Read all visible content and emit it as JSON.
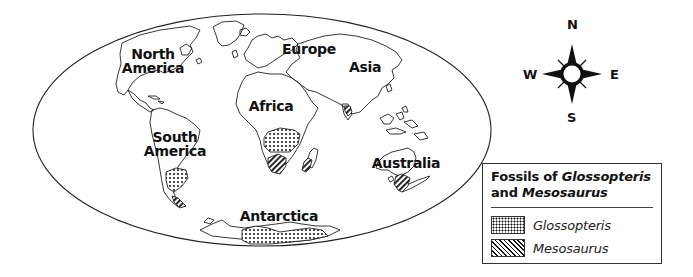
{
  "map": {
    "projection": "elliptical world map",
    "continents": [
      {
        "name": "North America",
        "lines": [
          "North",
          "America"
        ]
      },
      {
        "name": "South America",
        "lines": [
          "South",
          "America"
        ]
      },
      {
        "name": "Europe",
        "lines": [
          "Europe"
        ]
      },
      {
        "name": "Asia",
        "lines": [
          "Asia"
        ]
      },
      {
        "name": "Africa",
        "lines": [
          "Africa"
        ]
      },
      {
        "name": "Australia",
        "lines": [
          "Australia"
        ]
      },
      {
        "name": "Antarctica",
        "lines": [
          "Antarctica"
        ]
      }
    ],
    "fossil_regions": [
      {
        "location": "South America (southern)",
        "fossil": "Glossopteris"
      },
      {
        "location": "South America (tip)",
        "fossil": "Mesosaurus"
      },
      {
        "location": "Africa (central)",
        "fossil": "Glossopteris"
      },
      {
        "location": "Africa (southern)",
        "fossil": "Mesosaurus"
      },
      {
        "location": "Madagascar",
        "fossil": "Mesosaurus"
      },
      {
        "location": "India",
        "fossil": "Mesosaurus"
      },
      {
        "location": "Australia (southeast)",
        "fossil": "Mesosaurus"
      },
      {
        "location": "Antarctica",
        "fossil": "Glossopteris"
      }
    ]
  },
  "compass": {
    "north": "N",
    "south": "S",
    "east": "E",
    "west": "W"
  },
  "legend": {
    "title_prefix": "Fossils of ",
    "title_italic_1": "Glossopteris",
    "title_mid": "and ",
    "title_italic_2": "Mesosaurus",
    "items": [
      {
        "label": "Glossopteris",
        "pattern": "dots"
      },
      {
        "label": "Mesosaurus",
        "pattern": "diagonal-hatch"
      }
    ]
  },
  "colors": {
    "outline": "#111111",
    "background": "#ffffff"
  }
}
